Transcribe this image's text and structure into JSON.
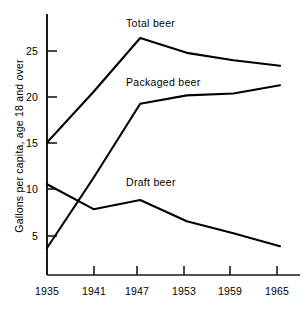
{
  "chart_data": {
    "type": "line",
    "title": "",
    "xlabel": "",
    "ylabel": "Gallons per capita, age 18 and over",
    "x": [
      1935,
      1941,
      1947,
      1953,
      1959,
      1965
    ],
    "xticklabels": [
      "1935",
      "1941",
      "1947",
      "1953",
      "1959",
      "1965"
    ],
    "yticks": [
      5,
      10,
      15,
      20,
      25
    ],
    "yticklabels": [
      "5",
      "10",
      "15",
      "20",
      "25"
    ],
    "xlim": [
      1935,
      1965
    ],
    "ylim": [
      0,
      29
    ],
    "grid": false,
    "legend": "inline-labels",
    "series": [
      {
        "name": "Total beer",
        "label": "Total beer",
        "values": [
          15.1,
          20.6,
          26.4,
          24.8,
          24.0,
          23.4
        ],
        "color": "#000000"
      },
      {
        "name": "Packaged beer",
        "label": "Packaged beer",
        "values": [
          3.7,
          11.3,
          19.3,
          20.2,
          20.4,
          21.3
        ],
        "color": "#000000"
      },
      {
        "name": "Draft beer",
        "label": "Draft beer",
        "values": [
          10.6,
          7.9,
          8.9,
          6.6,
          5.3,
          3.9
        ],
        "color": "#000000"
      }
    ],
    "annotations": [
      {
        "text": "Total beer",
        "x": 1944.0,
        "y": 28.4
      },
      {
        "text": "Packaged beer",
        "x": 1945.0,
        "y": 22.1
      },
      {
        "text": "Draft beer",
        "x": 1945.0,
        "y": 11.4
      }
    ]
  },
  "axes": {
    "y_axis_label": "Gallons per capita, age 18 and over",
    "y_tick_5": "5",
    "y_tick_10": "10",
    "y_tick_15": "15",
    "y_tick_20": "20",
    "y_tick_25": "25",
    "x_tick_1935": "1935",
    "x_tick_1941": "1941",
    "x_tick_1947": "1947",
    "x_tick_1953": "1953",
    "x_tick_1959": "1959",
    "x_tick_1965": "1965"
  },
  "labels": {
    "total_beer": "Total beer",
    "packaged_beer": "Packaged beer",
    "draft_beer": "Draft beer"
  },
  "colors": {
    "line": "#000000",
    "axis": "#1a1a1a",
    "background": "#ffffff",
    "text": "#000000"
  }
}
